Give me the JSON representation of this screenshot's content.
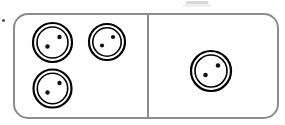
{
  "figure": {
    "kind": "domino-token-diagram",
    "title": "",
    "canvas": {
      "width": 285,
      "height": 125,
      "background": "#ffffff"
    },
    "board": {
      "x": 14,
      "y": 14,
      "width": 264,
      "height": 104,
      "corner_radius": 14,
      "stroke_color": "#8c8c8c",
      "stroke_width": 2,
      "fill_color": "#ffffff"
    },
    "divider": {
      "orientation": "vertical",
      "x": 148,
      "y_top": 15,
      "y_bottom": 117,
      "stroke_color": "#8c8c8c",
      "stroke_width": 2
    },
    "panels": [
      {
        "name": "left-panel",
        "token_count": 3,
        "label": "3"
      },
      {
        "name": "right-panel",
        "token_count": 1,
        "label": "1"
      }
    ],
    "token_style": {
      "outer_stroke_color": "#000000",
      "outer_stroke_width": 2.2,
      "inner_stroke_color": "#000000",
      "inner_stroke_width": 1.6,
      "pip_color": "#111111",
      "pips_per_token": 2,
      "fill_color": "#ffffff"
    },
    "tokens": [
      {
        "name": "token-left-top-left",
        "panel": "left-panel",
        "cx": 52.5,
        "cy": 42.5,
        "outer_r": 19.5,
        "inner_r": 15.5,
        "pips": [
          {
            "cx": 59.5,
            "cy": 37.0,
            "r": 2.2
          },
          {
            "cx": 47.5,
            "cy": 46.5,
            "r": 2.2
          }
        ]
      },
      {
        "name": "token-left-top-right",
        "panel": "left-panel",
        "cx": 107.0,
        "cy": 42.0,
        "outer_r": 18.0,
        "inner_r": 14.2,
        "pips": [
          {
            "cx": 113.0,
            "cy": 37.0,
            "r": 2.1
          },
          {
            "cx": 102.0,
            "cy": 45.5,
            "r": 2.1
          }
        ]
      },
      {
        "name": "token-left-bottom-left",
        "panel": "left-panel",
        "cx": 52.5,
        "cy": 88.5,
        "outer_r": 19.0,
        "inner_r": 15.2,
        "pips": [
          {
            "cx": 59.5,
            "cy": 83.0,
            "r": 2.2
          },
          {
            "cx": 47.5,
            "cy": 92.5,
            "r": 2.2
          }
        ]
      },
      {
        "name": "token-right-center",
        "panel": "right-panel",
        "cx": 211.0,
        "cy": 71.0,
        "outer_r": 20.0,
        "inner_r": 16.0,
        "pips": [
          {
            "cx": 218.0,
            "cy": 65.5,
            "r": 2.3
          },
          {
            "cx": 205.5,
            "cy": 75.0,
            "r": 2.3
          }
        ]
      }
    ],
    "artifacts": [
      {
        "name": "stray-dot-left-margin",
        "type": "dot",
        "cx": 3.5,
        "cy": 20.5,
        "r": 1.6,
        "color": "#5a5a5a"
      },
      {
        "name": "clipped-bar-top",
        "type": "rect",
        "x": 186,
        "y": 1,
        "width": 22,
        "height": 3,
        "color": "#d9d9d9"
      },
      {
        "name": "clipped-bar-top-faint",
        "type": "rect",
        "x": 183,
        "y": 4,
        "width": 28,
        "height": 3,
        "color": "#efefef"
      }
    ]
  }
}
